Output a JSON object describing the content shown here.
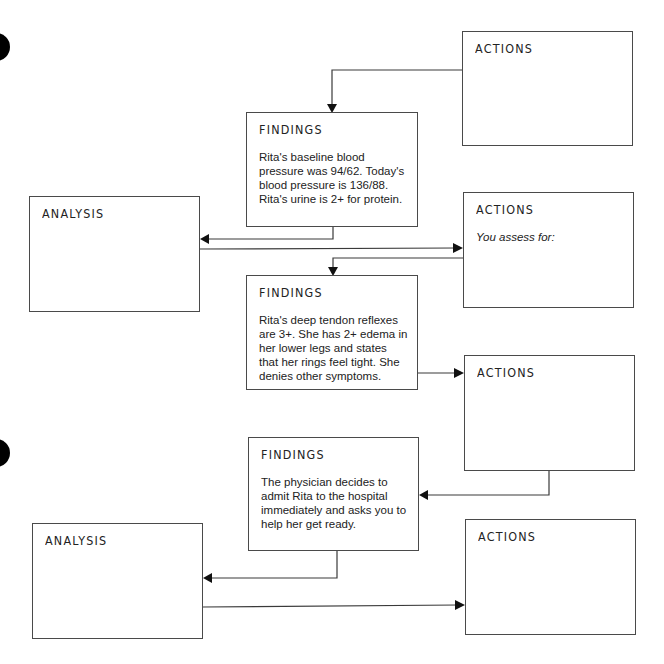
{
  "diagram": {
    "type": "clinical-reasoning-flowchart",
    "boxes": {
      "actions_1": {
        "title": "ACTIONS",
        "body": ""
      },
      "findings_1": {
        "title": "FINDINGS",
        "body": "Rita's baseline blood pressure was 94/62. Today's blood pressure is 136/88. Rita's urine is 2+ for protein."
      },
      "analysis_1": {
        "title": "ANALYSIS",
        "body": ""
      },
      "actions_2": {
        "title": "ACTIONS",
        "body": "You assess for:"
      },
      "findings_2": {
        "title": "FINDINGS",
        "body": "Rita's deep tendon reflexes are 3+. She has 2+ edema in her lower legs and states that her rings feel tight. She denies other symptoms."
      },
      "actions_3": {
        "title": "ACTIONS",
        "body": ""
      },
      "findings_3": {
        "title": "FINDINGS",
        "body": "The physician decides to admit Rita to the hospital immediately and asks you to help her get ready."
      },
      "analysis_2": {
        "title": "ANALYSIS",
        "body": ""
      },
      "actions_4": {
        "title": "ACTIONS",
        "body": ""
      }
    },
    "connections": [
      {
        "from": "actions_1",
        "to": "findings_1"
      },
      {
        "from": "findings_1",
        "to": "analysis_1"
      },
      {
        "from": "analysis_1",
        "to": "actions_2"
      },
      {
        "from": "actions_2",
        "to": "findings_2"
      },
      {
        "from": "findings_2",
        "to": "actions_3"
      },
      {
        "from": "actions_3",
        "to": "findings_3"
      },
      {
        "from": "findings_3",
        "to": "analysis_2"
      },
      {
        "from": "analysis_2",
        "to": "actions_4"
      }
    ],
    "colors": {
      "border": "#4a4a4a",
      "line": "#3a3a3a",
      "arrowhead": "#111111",
      "punch_hole": "#000000",
      "background": "#ffffff"
    }
  }
}
